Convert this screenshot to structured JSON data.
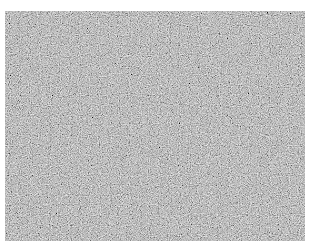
{
  "image": {
    "description": "grayscale noise texture",
    "base_color": "#8a8a8a",
    "background": "#ffffff"
  }
}
